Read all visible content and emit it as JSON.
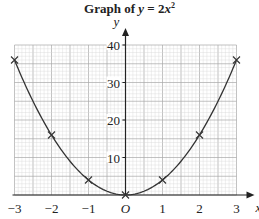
{
  "chart_data": {
    "type": "line",
    "title_parts": {
      "prefix": "Graph of ",
      "var": "y",
      "eq": " = 2",
      "x": "x",
      "exp": "2"
    },
    "xlabel": "x",
    "ylabel": "y",
    "origin_label": "O",
    "xlim": [
      -3,
      3
    ],
    "ylim": [
      0,
      40
    ],
    "x_ticks": [
      -3,
      -2,
      -1,
      0,
      1,
      2,
      3
    ],
    "x_tick_labels": [
      "−3",
      "−2",
      "−1",
      "O",
      "1",
      "2",
      "3"
    ],
    "y_ticks": [
      10,
      20,
      30,
      40
    ],
    "y_tick_labels": [
      "10",
      "20",
      "30",
      "40"
    ],
    "grid": true,
    "series": [
      {
        "name": "y = 2x²",
        "x": [
          -3,
          -2,
          -1,
          0,
          1,
          2,
          3
        ],
        "values": [
          18,
          8,
          2,
          0,
          2,
          8,
          18
        ],
        "marker": "x"
      }
    ],
    "marked_points": [
      [
        -3,
        36
      ],
      [
        -2,
        16
      ],
      [
        -1,
        4
      ],
      [
        0,
        0
      ],
      [
        1,
        4
      ],
      [
        2,
        16
      ],
      [
        3,
        36
      ]
    ]
  },
  "colors": {
    "curve": "#333333",
    "grid_minor": "#d6d6d6",
    "grid_major": "#a8a8a8",
    "axis": "#222222"
  }
}
